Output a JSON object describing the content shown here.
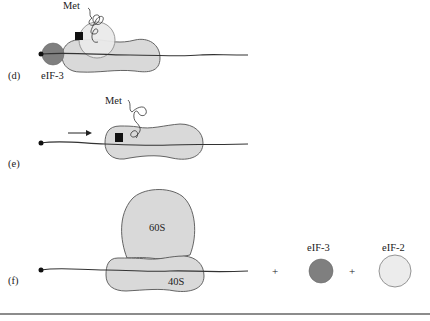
{
  "figure": {
    "panels": [
      {
        "id": "d",
        "label": "(d)",
        "components": [
          "mRNA",
          "40S subunit",
          "eIF-2",
          "eIF-3",
          "Met-tRNA",
          "start codon marker"
        ],
        "labels": {
          "met": "Met",
          "eif3": "eIF-3"
        }
      },
      {
        "id": "e",
        "label": "(e)",
        "components": [
          "mRNA",
          "40S subunit",
          "Met-tRNA",
          "start codon marker",
          "scanning arrow"
        ],
        "labels": {
          "met": "Met"
        }
      },
      {
        "id": "f",
        "label": "(f)",
        "components": [
          "mRNA",
          "40S subunit",
          "60S subunit"
        ],
        "labels": {
          "sub60": "60S",
          "sub40": "40S"
        }
      }
    ],
    "released_factors": {
      "plus_1": "+",
      "plus_2": "+",
      "eif3": "eIF-3",
      "eif2": "eIF-2"
    },
    "colors": {
      "subunit_fill": "#d9d9d9",
      "eif3_fill": "#7f7f7f",
      "eif2_fill": "#ececec",
      "start_marker": "#111111",
      "line": "#333333"
    }
  }
}
